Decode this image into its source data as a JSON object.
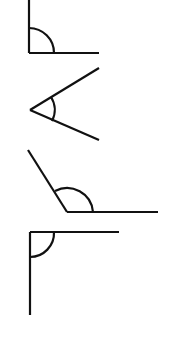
{
  "diagram": {
    "title": "",
    "stroke_color": "#111111",
    "background": "#ffffff",
    "angles": [
      {
        "name": "right-angle-open-up-right",
        "kind": "right",
        "vertex": [
          29,
          53
        ],
        "ray1_end": [
          29,
          0
        ],
        "ray2_end": [
          99,
          53
        ],
        "arc": "M29 28 A25 25 0 0 1 54 53"
      },
      {
        "name": "acute-angle-open-right",
        "kind": "acute",
        "vertex": [
          30,
          110
        ],
        "ray1_end": [
          99,
          68
        ],
        "ray2_end": [
          99,
          140
        ],
        "arc": "M51 97 A24 24 0 0 1 52 121"
      },
      {
        "name": "obtuse-angle-open-up",
        "kind": "obtuse",
        "vertex": [
          67,
          212
        ],
        "ray1_end": [
          28,
          150
        ],
        "ray2_end": [
          158,
          212
        ],
        "arc": "M55 191 A26 26 0 0 1 93 212"
      },
      {
        "name": "right-angle-open-down-right",
        "kind": "right",
        "vertex": [
          30,
          232
        ],
        "ray1_end": [
          119,
          232
        ],
        "ray2_end": [
          30,
          315
        ],
        "arc": "M54 232 A24 24 0 0 1 30 257"
      }
    ]
  }
}
